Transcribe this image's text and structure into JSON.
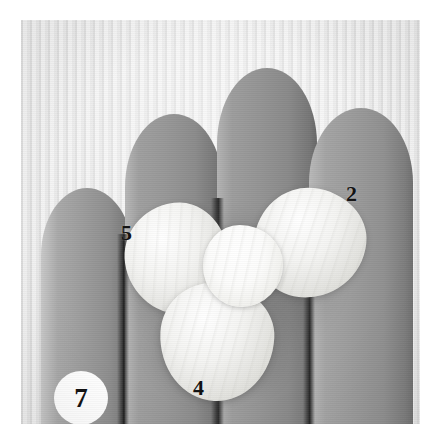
{
  "figure": {
    "badge_number": "7",
    "medium": "black-and-white photograph"
  },
  "photo": {
    "background_description": "pale vertically-woven cloth backdrop",
    "background_color": "#f1f1f1",
    "finger_color": "#9a9a9a",
    "crease_color": "#2e2e2e",
    "specimen_color": "#f2f2ee",
    "label_color": "#111111"
  },
  "callouts": [
    {
      "id": "callout-2",
      "label": "2",
      "target": "right lobe"
    },
    {
      "id": "callout-5",
      "label": "5",
      "target": "left lobe"
    },
    {
      "id": "callout-4",
      "label": "4",
      "target": "bottom lobe"
    }
  ],
  "hand": {
    "fingers": [
      {
        "name": "little-finger"
      },
      {
        "name": "ring-finger"
      },
      {
        "name": "middle-finger"
      },
      {
        "name": "index-finger"
      }
    ]
  },
  "specimen": {
    "parts": [
      {
        "name": "left-lobe"
      },
      {
        "name": "right-lobe"
      },
      {
        "name": "bottom-lobe"
      },
      {
        "name": "central-core"
      }
    ]
  }
}
